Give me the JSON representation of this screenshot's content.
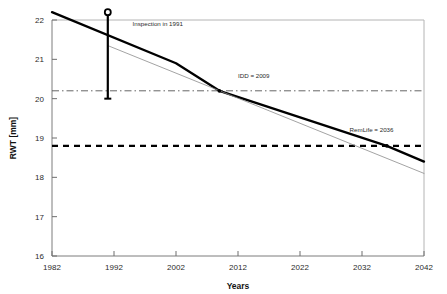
{
  "chart_data": {
    "type": "line",
    "title": "",
    "xlabel": "Years",
    "ylabel": "RWT [mm]",
    "xlim": [
      1982,
      2042
    ],
    "ylim": [
      16,
      22
    ],
    "xticks": [
      1982,
      1992,
      2002,
      2012,
      2022,
      2032,
      2042
    ],
    "xtick_labels": [
      "1982",
      "1992",
      "2002",
      "2012",
      "2022",
      "2032",
      "2042"
    ],
    "yticks": [
      16,
      17,
      18,
      19,
      20,
      21,
      22
    ],
    "ytick_labels": [
      "16",
      "17",
      "18",
      "19",
      "20",
      "21",
      "22"
    ],
    "grid": false,
    "legend": "none",
    "series": [
      {
        "name": "RWT wall thickness trend",
        "style": "solid-thick",
        "color": "#000000",
        "x": [
          1982,
          2002,
          2009,
          2036,
          2042
        ],
        "y": [
          22.2,
          20.9,
          20.2,
          18.8,
          18.4
        ]
      },
      {
        "name": "Projection line",
        "style": "solid-thin",
        "color": "#8c8c8c",
        "x": [
          1991,
          2042
        ],
        "y": [
          21.35,
          18.1
        ]
      }
    ],
    "reference_lines": [
      {
        "name": "IDD level",
        "orientation": "horizontal",
        "value": 20.2,
        "style": "dash-dot",
        "color": "#555555"
      },
      {
        "name": "Minimum allowable RWT",
        "orientation": "vertical_none",
        "value": 18.8,
        "style": "dashed",
        "color": "#000000"
      }
    ],
    "markers": [
      {
        "name": "inspection-marker",
        "x": 1991,
        "y_top": 22.2,
        "y_bottom": 20.0,
        "symbol": "circle-open"
      },
      {
        "name": "idd-point",
        "x": 2009,
        "y": 20.2,
        "symbol": "dot"
      },
      {
        "name": "remlife-point",
        "x": 2036,
        "y": 18.8,
        "symbol": "dot"
      }
    ],
    "annotations": [
      {
        "name": "inspection-annotation",
        "text": "Inspection in 1991",
        "x": 1995,
        "y": 21.85
      },
      {
        "name": "idd-annotation",
        "text": "IDD = 2009",
        "x": 2012,
        "y": 20.52
      },
      {
        "name": "remlife-annotation",
        "text": "RemLife = 2036",
        "x": 2030,
        "y": 19.15
      }
    ]
  },
  "axes": {
    "x_title": "Years",
    "y_title": "RWT [mm]"
  },
  "colors": {
    "line": "#000000",
    "projection": "#8c8c8c",
    "idd_reference": "#555555",
    "min_rwt_reference": "#000000",
    "axis": "#9a9a9a",
    "background": "#ffffff"
  }
}
